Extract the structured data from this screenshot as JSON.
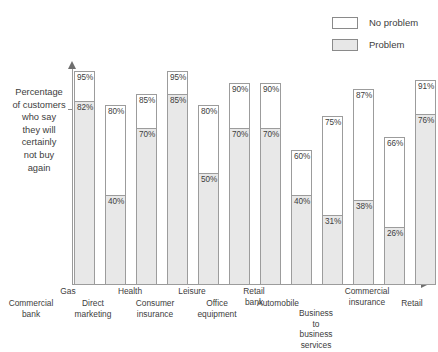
{
  "legend": {
    "items": [
      {
        "label": "No problem",
        "swatch": "white",
        "color": "#ffffff"
      },
      {
        "label": "Problem",
        "swatch": "shaded",
        "color": "#e7e7e7"
      }
    ]
  },
  "axes": {
    "y_label": "Percentage of customers who say they will certainly not buy again",
    "y_label_lines": "Percentage\nof customers\nwho say\nthey will\ncertainly\nnot buy\nagain"
  },
  "chart_data": {
    "type": "bar",
    "title": "",
    "subtitle": "",
    "xlabel": "",
    "ylabel": "Percentage of customers who say they will certainly not buy again",
    "ylim": [
      0,
      100
    ],
    "grid": false,
    "legend_position": "top-right",
    "stacked": true,
    "categories": [
      "Commercial bank",
      "Gas",
      "Direct marketing",
      "Health",
      "Consumer insurance",
      "Leisure",
      "Office equipment",
      "Retail bank",
      "Automobile",
      "Business to business services",
      "Commercial insurance",
      "Retail"
    ],
    "series": [
      {
        "name": "Problem",
        "color": "#e8e8e8",
        "values": [
          82,
          40,
          70,
          85,
          50,
          70,
          70,
          40,
          31,
          38,
          26,
          76
        ]
      },
      {
        "name": "No problem",
        "color": "#ffffff",
        "values": [
          95,
          80,
          85,
          95,
          80,
          90,
          90,
          60,
          75,
          87,
          66,
          91
        ]
      }
    ],
    "annotations": [
      {
        "category": "Commercial bank",
        "no_problem": "95%",
        "problem": "82%"
      },
      {
        "category": "Gas",
        "no_problem": "80%",
        "problem": "40%"
      },
      {
        "category": "Direct marketing",
        "no_problem": "85%",
        "problem": "70%"
      },
      {
        "category": "Health",
        "no_problem": "95%",
        "problem": "85%"
      },
      {
        "category": "Consumer insurance",
        "no_problem": "80%",
        "problem": "50%"
      },
      {
        "category": "Leisure",
        "no_problem": "90%",
        "problem": "70%"
      },
      {
        "category": "Office equipment",
        "no_problem": "90%",
        "problem": "70%"
      },
      {
        "category": "Retail bank",
        "no_problem": "60%",
        "problem": "40%"
      },
      {
        "category": "Automobile",
        "no_problem": "75%",
        "problem": "31%"
      },
      {
        "category": "Business to business services",
        "no_problem": "87%",
        "problem": "38%"
      },
      {
        "category": "Commercial insurance",
        "no_problem": "66%",
        "problem": "26%"
      },
      {
        "category": "Retail",
        "no_problem": "91%",
        "problem": "76%"
      }
    ]
  },
  "bars": [
    {
      "name": "commercial-bank",
      "top_value": "95%",
      "bottom_value": "82%",
      "top": 95,
      "bottom": 82,
      "x": 2,
      "label": "Commercial\nbank",
      "label_row": 2,
      "label_x": 0,
      "label_w": 62
    },
    {
      "name": "gas",
      "top_value": "80%",
      "bottom_value": "40%",
      "top": 80,
      "bottom": 40,
      "x": 33,
      "label": "Gas",
      "label_row": 1,
      "label_x": 44,
      "label_w": 48
    },
    {
      "name": "direct-marketing",
      "top_value": "85%",
      "bottom_value": "70%",
      "top": 85,
      "bottom": 70,
      "x": 64,
      "label": "Direct\nmarketing",
      "label_row": 2,
      "label_x": 62,
      "label_w": 62
    },
    {
      "name": "health",
      "top_value": "95%",
      "bottom_value": "85%",
      "top": 95,
      "bottom": 85,
      "x": 95,
      "label": "Health",
      "label_row": 1,
      "label_x": 106,
      "label_w": 48
    },
    {
      "name": "consumer-insurance",
      "top_value": "80%",
      "bottom_value": "50%",
      "top": 80,
      "bottom": 50,
      "x": 126,
      "label": "Consumer\ninsurance",
      "label_row": 2,
      "label_x": 124,
      "label_w": 62
    },
    {
      "name": "leisure",
      "top_value": "90%",
      "bottom_value": "70%",
      "top": 90,
      "bottom": 70,
      "x": 157,
      "label": "Leisure",
      "label_row": 1,
      "label_x": 168,
      "label_w": 48
    },
    {
      "name": "office-equipment",
      "top_value": "90%",
      "bottom_value": "70%",
      "top": 90,
      "bottom": 70,
      "x": 188,
      "label": "Office\nequipment",
      "label_row": 2,
      "label_x": 186,
      "label_w": 62
    },
    {
      "name": "retail-bank",
      "top_value": "60%",
      "bottom_value": "40%",
      "top": 60,
      "bottom": 40,
      "x": 219,
      "label": "Retail\nbank",
      "label_row": 1,
      "label_x": 230,
      "label_w": 48
    },
    {
      "name": "automobile",
      "top_value": "75%",
      "bottom_value": "31%",
      "top": 75,
      "bottom": 31,
      "x": 250,
      "label": "Automobile",
      "label_row": 2,
      "label_x": 246,
      "label_w": 64
    },
    {
      "name": "business-to-business-services",
      "top_value": "87%",
      "bottom_value": "38%",
      "top": 87,
      "bottom": 38,
      "x": 281,
      "label": "Business\nto\nbusiness\nservices",
      "label_row": 3,
      "label_x": 292,
      "label_w": 48
    },
    {
      "name": "commercial-insurance",
      "top_value": "66%",
      "bottom_value": "26%",
      "top": 66,
      "bottom": 26,
      "x": 312,
      "label": "Commercial\ninsurance",
      "label_row": 1,
      "label_x": 336,
      "label_w": 62
    },
    {
      "name": "retail",
      "top_value": "91%",
      "bottom_value": "76%",
      "top": 91,
      "bottom": 76,
      "x": 343,
      "label": "Retail",
      "label_row": 2,
      "label_x": 390,
      "label_w": 44
    }
  ]
}
